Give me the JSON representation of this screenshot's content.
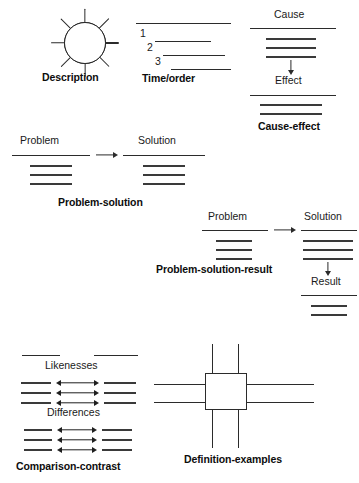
{
  "figure": {
    "background": "#ffffff",
    "ink": "#2b2b2b"
  },
  "organizers": [
    {
      "id": "description",
      "caption": "Description",
      "icon": "sun-icon",
      "rays": 8,
      "lines": []
    },
    {
      "id": "time-order",
      "caption": "Time/order",
      "numbers": [
        "1",
        "2",
        "3"
      ],
      "lines": [
        "topic-rule",
        "step-rule-1",
        "step-rule-2",
        "step-rule-3"
      ]
    },
    {
      "id": "cause-effect",
      "caption": "Cause-effect",
      "headings": [
        "Cause",
        "Effect"
      ],
      "cause_detail_lines": 3,
      "effect_detail_lines": 2,
      "connector": "arrow-down"
    },
    {
      "id": "problem-solution",
      "caption": "Problem-solution",
      "headings": [
        "Problem",
        "Solution"
      ],
      "problem_detail_lines": 3,
      "solution_detail_lines": 3,
      "connector": "arrow-right"
    },
    {
      "id": "problem-solution-result",
      "caption": "Problem-solution-result",
      "headings": [
        "Problem",
        "Solution",
        "Result"
      ],
      "problem_detail_lines": 3,
      "solution_detail_lines": 3,
      "result_detail_lines": 2,
      "connectors": [
        "arrow-right",
        "arrow-down"
      ]
    },
    {
      "id": "comparison-contrast",
      "caption": "Comparison-contrast",
      "headings": [
        "Likenesses",
        "Differences"
      ],
      "likeness_rows": 3,
      "difference_rows": 3,
      "connector": "double-arrow"
    },
    {
      "id": "definition-examples",
      "caption": "Definition-examples",
      "shape": "rectangle",
      "spokes": {
        "up": 2,
        "down": 2,
        "left": 2,
        "right": 2
      }
    }
  ],
  "labels": {
    "description": "Description",
    "time_order": "Time/order",
    "cause": "Cause",
    "effect": "Effect",
    "cause_effect": "Cause-effect",
    "problem": "Problem",
    "solution": "Solution",
    "problem_solution": "Problem-solution",
    "problem2": "Problem",
    "solution2": "Solution",
    "result": "Result",
    "problem_solution_result": "Problem-solution-result",
    "likenesses": "Likenesses",
    "differences": "Differences",
    "comparison_contrast": "Comparison-contrast",
    "definition_examples": "Definition-examples",
    "order_1": "1",
    "order_2": "2",
    "order_3": "3"
  }
}
